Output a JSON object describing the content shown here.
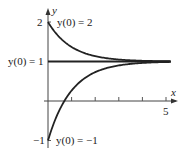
{
  "chart_data": {
    "type": "line",
    "title": "",
    "xlabel": "x",
    "ylabel": "y",
    "xlim": [
      0,
      5.2
    ],
    "ylim": [
      -1,
      2
    ],
    "x_ticks": [
      1,
      2,
      3,
      4,
      5
    ],
    "x_tick_labels": [
      "",
      "",
      "",
      "",
      "5"
    ],
    "y_tick_labels": [
      "2",
      "1",
      "-1"
    ],
    "grid": false,
    "legend": null,
    "series": [
      {
        "name": "y(0) = 2",
        "formula": "1 + e^(-x)",
        "x": [
          0,
          1,
          2,
          3,
          4,
          5
        ],
        "values": [
          2,
          1.37,
          1.14,
          1.05,
          1.02,
          1.01
        ]
      },
      {
        "name": "y(0) = 1",
        "formula": "1",
        "x": [
          0,
          1,
          2,
          3,
          4,
          5
        ],
        "values": [
          1,
          1,
          1,
          1,
          1,
          1
        ]
      },
      {
        "name": "y(0) = -1",
        "formula": "1 - 2e^(-x)",
        "x": [
          0,
          1,
          2,
          3,
          4,
          5
        ],
        "values": [
          -1,
          0.26,
          0.73,
          0.9,
          0.96,
          0.99
        ]
      }
    ],
    "annotations": [
      "y(0) = 2",
      "y(0) = 1",
      "y(0) = -1"
    ]
  },
  "labels": {
    "x_axis": "x",
    "y_axis": "y",
    "tick_2": "2",
    "tick_1_annot": "y(0) = 1",
    "tick_neg1": "−1",
    "tick_5": "5",
    "annot_top": "y(0) = 2",
    "annot_bottom": "y(0) = −1"
  },
  "colors": {
    "curve": "#222222",
    "axis": "#333333"
  }
}
